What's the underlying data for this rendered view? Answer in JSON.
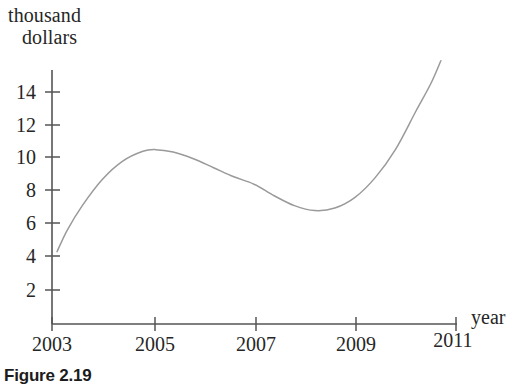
{
  "figure": {
    "caption": "Figure 2.19"
  },
  "chart_data": {
    "type": "line",
    "title": "",
    "subtitle": "",
    "xlabel": "year",
    "ylabel": "thousand dollars",
    "ylabel_line1": "thousand",
    "ylabel_line2": "dollars",
    "grid": false,
    "legend": null,
    "axis_color": "#555555",
    "curve_color": "#9a9a9a",
    "xlim": [
      2003,
      2011
    ],
    "ylim": [
      0,
      16
    ],
    "xticks": [
      2003,
      2005,
      2007,
      2009,
      2011
    ],
    "xticklabels": [
      "2003",
      "2005",
      "2007",
      "2009",
      "2011"
    ],
    "yticks": [
      2,
      4,
      6,
      8,
      10,
      12,
      14
    ],
    "yticklabels": [
      "2",
      "4",
      "6",
      "8",
      "10",
      "12",
      "14"
    ],
    "series": [
      {
        "name": "value",
        "x": [
          2003.1,
          2003.3,
          2003.6,
          2004.0,
          2004.4,
          2004.8,
          2005.05,
          2005.4,
          2005.8,
          2006.2,
          2006.6,
          2007.0,
          2007.4,
          2007.8,
          2008.2,
          2008.6,
          2009.0,
          2009.4,
          2009.8,
          2010.2,
          2010.5,
          2010.7
        ],
        "y": [
          4.3,
          5.6,
          7.1,
          8.7,
          9.8,
          10.4,
          10.5,
          10.35,
          9.95,
          9.4,
          8.85,
          8.4,
          7.7,
          7.1,
          6.8,
          6.95,
          7.6,
          8.8,
          10.5,
          12.8,
          14.5,
          15.9
        ]
      }
    ],
    "annotations": {
      "peak": {
        "x": 2005.05,
        "y": 10.5
      },
      "trough": {
        "x": 2008.2,
        "y": 6.8
      },
      "start": {
        "x": 2003.1,
        "y": 4.3
      },
      "end": {
        "x": 2010.7,
        "y": 15.9
      }
    }
  }
}
